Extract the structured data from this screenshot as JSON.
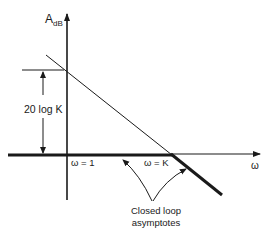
{
  "diagram": {
    "y_axis_label": "A",
    "y_axis_subscript": "dB",
    "x_axis_label": "ω",
    "gain_label": "20 log K",
    "break_label_1": "ω = 1",
    "break_label_2": "ω = K",
    "annotation_line1": "Closed loop",
    "annotation_line2": "asymptotes",
    "colors": {
      "ink": "#1a1a1a",
      "background": "#ffffff"
    }
  }
}
